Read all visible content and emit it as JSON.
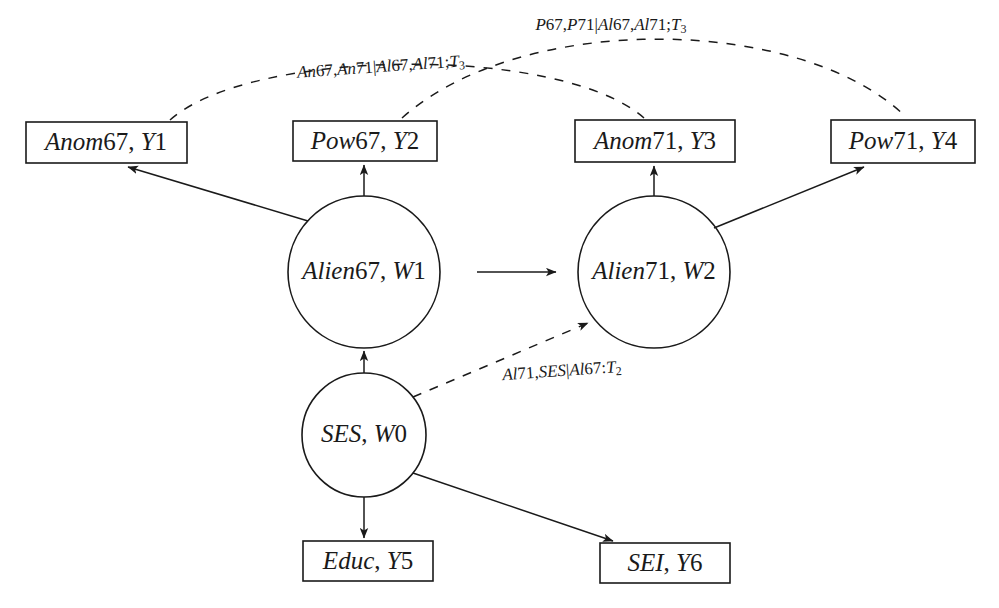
{
  "diagram": {
    "type": "path-diagram",
    "background_color": "#ffffff",
    "stroke_color": "#1a1a1a",
    "boxes": [
      {
        "id": "anom67",
        "label": "Anom67, Y1",
        "x": 26,
        "y": 122,
        "w": 161,
        "h": 41,
        "label_italic_part": "Anom",
        "label_roman_part": "67, Y1"
      },
      {
        "id": "pow67",
        "label": "Pow67, Y2",
        "x": 293,
        "y": 121,
        "w": 144,
        "h": 40,
        "label_italic_part": "Pow",
        "label_roman_part": "67, Y2"
      },
      {
        "id": "anom71",
        "label": "Anom71, Y3",
        "x": 575,
        "y": 120,
        "w": 160,
        "h": 42,
        "label_italic_part": "Anom",
        "label_roman_part": "71, Y3"
      },
      {
        "id": "pow71",
        "label": "Pow71, Y4",
        "x": 831,
        "y": 120,
        "w": 144,
        "h": 43,
        "label_italic_part": "Pow",
        "label_roman_part": "71, Y4"
      },
      {
        "id": "educ",
        "label": "Educ, Y5",
        "x": 303,
        "y": 541,
        "w": 130,
        "h": 40,
        "label_italic_part": "Educ",
        "label_roman_part": ", Y5"
      },
      {
        "id": "sei",
        "label": "SEI, Y6",
        "x": 600,
        "y": 543,
        "w": 130,
        "h": 40,
        "label_italic_part": "SEI",
        "label_roman_part": ", Y6"
      }
    ],
    "circles": [
      {
        "id": "alien67",
        "label": "Alien67, W1",
        "cx": 364,
        "cy": 272,
        "r": 76
      },
      {
        "id": "alien71",
        "label": "Alien71, W2",
        "cx": 654,
        "cy": 272,
        "r": 76
      },
      {
        "id": "ses",
        "label": "SES, W0",
        "cx": 364,
        "cy": 435,
        "r": 62
      }
    ],
    "edges": [
      {
        "id": "alien67-to-anom67",
        "from": "alien67",
        "to": "anom67",
        "style": "solid",
        "arrow": true
      },
      {
        "id": "alien67-to-pow67",
        "from": "alien67",
        "to": "pow67",
        "style": "solid",
        "arrow": true
      },
      {
        "id": "alien67-to-alien71",
        "from": "alien67",
        "to": "alien71",
        "style": "solid",
        "arrow": true
      },
      {
        "id": "alien71-to-anom71",
        "from": "alien71",
        "to": "anom71",
        "style": "solid",
        "arrow": true
      },
      {
        "id": "alien71-to-pow71",
        "from": "alien71",
        "to": "pow71",
        "style": "solid",
        "arrow": true
      },
      {
        "id": "ses-to-alien67",
        "from": "ses",
        "to": "alien67",
        "style": "solid",
        "arrow": true
      },
      {
        "id": "ses-to-educ",
        "from": "ses",
        "to": "educ",
        "style": "solid",
        "arrow": true
      },
      {
        "id": "ses-to-sei",
        "from": "ses",
        "to": "sei",
        "style": "solid",
        "arrow": true
      },
      {
        "id": "ses-to-alien71",
        "from": "ses",
        "to": "alien71",
        "style": "dashed",
        "arrow": true,
        "label": "Al71,SES|Al67:T2"
      },
      {
        "id": "anom67-to-anom71",
        "from": "anom67",
        "to": "anom71",
        "style": "dashed",
        "arrow": false,
        "label": "An67,An71|Al67,Al71;T3"
      },
      {
        "id": "pow67-to-pow71",
        "from": "pow67",
        "to": "pow71",
        "style": "dashed",
        "arrow": false,
        "label": "P67,P71|Al67,Al71;T3"
      }
    ],
    "edge_labels": [
      {
        "id": "label-pow-correlation",
        "x": 611,
        "y": 26,
        "segments": [
          {
            "text": "P",
            "style": "italic"
          },
          {
            "text": "67,",
            "style": "roman"
          },
          {
            "text": "P",
            "style": "italic"
          },
          {
            "text": "71|",
            "style": "roman"
          },
          {
            "text": "Al",
            "style": "italic"
          },
          {
            "text": "67,",
            "style": "roman"
          },
          {
            "text": "Al",
            "style": "italic"
          },
          {
            "text": "71;",
            "style": "roman"
          },
          {
            "text": "T",
            "style": "script"
          },
          {
            "text": "3",
            "style": "subscript"
          }
        ],
        "plain": "P67,P71|Al67,Al71;T3"
      },
      {
        "id": "label-anom-correlation",
        "x": 381,
        "y": 68,
        "segments": [
          {
            "text": "An",
            "style": "italic"
          },
          {
            "text": "67,",
            "style": "roman"
          },
          {
            "text": "An",
            "style": "italic"
          },
          {
            "text": "71|",
            "style": "roman"
          },
          {
            "text": "Al",
            "style": "italic"
          },
          {
            "text": "67,",
            "style": "roman"
          },
          {
            "text": "Al",
            "style": "italic"
          },
          {
            "text": "71;",
            "style": "roman"
          },
          {
            "text": "T",
            "style": "script"
          },
          {
            "text": "3",
            "style": "subscript"
          }
        ],
        "plain": "An67,An71|Al67,Al71;T3"
      },
      {
        "id": "label-ses-alien71",
        "x": 562,
        "y": 372,
        "segments": [
          {
            "text": "Al",
            "style": "italic"
          },
          {
            "text": "71,",
            "style": "roman"
          },
          {
            "text": "SES",
            "style": "italic"
          },
          {
            "text": "|",
            "style": "roman"
          },
          {
            "text": "Al",
            "style": "italic"
          },
          {
            "text": "67:",
            "style": "roman"
          },
          {
            "text": "T",
            "style": "script"
          },
          {
            "text": "2",
            "style": "subscript"
          }
        ],
        "plain": "Al71,SES|Al67:T2"
      }
    ]
  }
}
